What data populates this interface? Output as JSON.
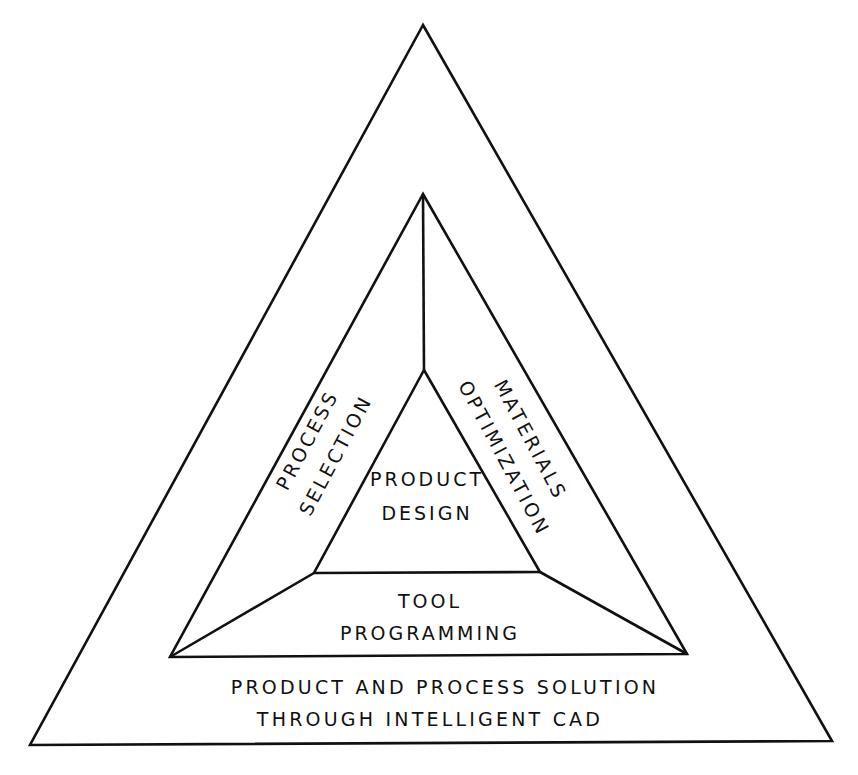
{
  "diagram": {
    "type": "nested-triangle",
    "colors": {
      "line": "#111111",
      "background": "#ffffff"
    },
    "outer_triangle": {
      "label_line1": "PRODUCT AND PROCESS SOLUTION",
      "label_line2": "THROUGH INTELLIGENT CAD"
    },
    "middle_sections": {
      "left": {
        "line1": "PROCESS",
        "line2": "SELECTION"
      },
      "right": {
        "line1": "MATERIALS",
        "line2": "OPTIMIZATION"
      },
      "bottom": {
        "line1": "TOOL",
        "line2": "PROGRAMMING"
      }
    },
    "inner_triangle": {
      "line1": "PRODUCT",
      "line2": "DESIGN"
    }
  }
}
